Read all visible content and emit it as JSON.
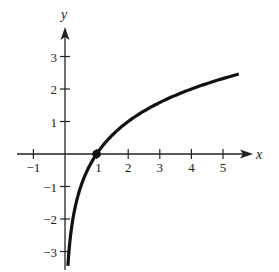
{
  "chart_data": {
    "type": "line",
    "title": "",
    "function": "y = log2(x)",
    "xlabel": "x",
    "ylabel": "y",
    "xlim": [
      -1.5,
      5.9
    ],
    "ylim": [
      -3.6,
      4.1
    ],
    "xticks": [
      -1,
      1,
      2,
      3,
      4,
      5
    ],
    "xtick_labels": [
      "−1",
      "1",
      "2",
      "3",
      "4",
      "5"
    ],
    "yticks": [
      -3,
      -2,
      -1,
      1,
      2,
      3
    ],
    "ytick_labels": [
      "−3",
      "−2",
      "−1",
      "1",
      "2",
      "3"
    ],
    "grid": false,
    "legend": null,
    "series": [
      {
        "name": "log2(x)",
        "x": [
          0.105,
          0.125,
          0.25,
          0.5,
          1,
          1.5,
          2,
          3,
          4,
          5,
          5.5
        ],
        "y": [
          -3.25,
          -3.0,
          -2.0,
          -1.0,
          0,
          0.585,
          1.0,
          1.585,
          2.0,
          2.322,
          2.459
        ]
      }
    ],
    "annotations": [
      {
        "type": "point",
        "x": 1,
        "y": 0,
        "style": "filled-dot"
      }
    ],
    "colors": {
      "axis": "#222222",
      "curve": "#111111",
      "text": "#222222"
    }
  }
}
